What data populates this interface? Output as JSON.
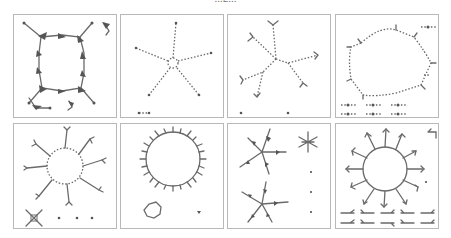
{
  "figure": {
    "caption_fragment": "...g...",
    "layout": {
      "rows": 2,
      "cols": 4
    },
    "stroke_color": "#6a6a6a",
    "border_color": "#b8b8b8",
    "panels": [
      {
        "id": "p1",
        "row": 0,
        "col": 0,
        "description": "square cycle of 8 arrow-shaped clusters with four radial leaves, plus small disconnected components"
      },
      {
        "id": "p2",
        "row": 0,
        "col": 1,
        "description": "five-armed star with dotted chains from a small central ring, plus a 2-node component"
      },
      {
        "id": "p3",
        "row": 0,
        "col": 2,
        "description": "tree with five dotted branches ending in forked tips, plus two isolated nodes"
      },
      {
        "id": "p4",
        "row": 0,
        "col": 3,
        "description": "large dotted ring with small spurs, plus seven small chain components"
      },
      {
        "id": "p5",
        "row": 1,
        "col": 0,
        "description": "ring with eight radial forked branches, plus a small cross component and three isolated nodes"
      },
      {
        "id": "p6",
        "row": 1,
        "col": 1,
        "description": "large ring with many short spurs, a small ring and an isolated node"
      },
      {
        "id": "p7",
        "row": 1,
        "col": 2,
        "description": "two star-shaped components, one small asterisk component and isolated nodes"
      },
      {
        "id": "p8",
        "row": 1,
        "col": 3,
        "description": "ring with twelve radial forked arrows, plus ten small forked components"
      }
    ]
  }
}
